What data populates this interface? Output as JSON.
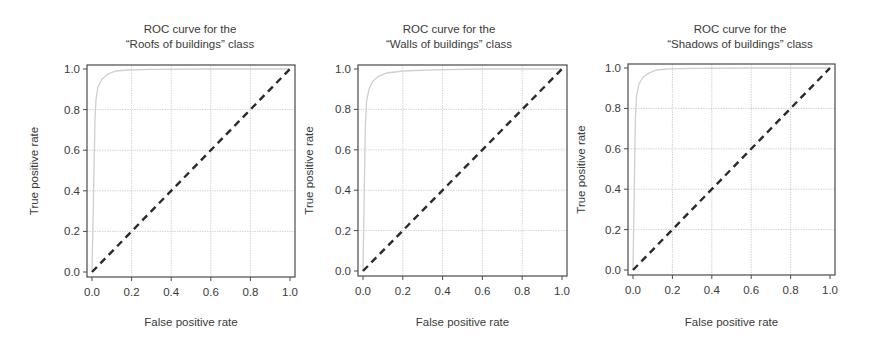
{
  "chart_data": [
    {
      "type": "line",
      "title": "ROC curve for the “Roofs of buildings” class",
      "title_lines": [
        "ROC curve for the",
        "“Roofs of buildings” class"
      ],
      "xlabel": "False positive rate",
      "ylabel": "True positive rate",
      "xlim": [
        0,
        1
      ],
      "ylim": [
        0,
        1
      ],
      "xticks": [
        "0.0",
        "0.2",
        "0.4",
        "0.6",
        "0.8",
        "1.0"
      ],
      "yticks": [
        "0.0",
        "0.2",
        "0.4",
        "0.6",
        "0.8",
        "1.0"
      ],
      "grid": true,
      "legend": null,
      "series": [
        {
          "name": "ROC curve",
          "style": "solid light gray",
          "x": [
            0.0,
            0.01,
            0.015,
            0.02,
            0.03,
            0.05,
            0.08,
            0.12,
            0.18,
            0.3,
            0.6,
            1.0
          ],
          "y": [
            0.0,
            0.5,
            0.75,
            0.85,
            0.91,
            0.95,
            0.975,
            0.99,
            0.995,
            0.998,
            1.0,
            1.0
          ]
        },
        {
          "name": "Random classifier",
          "style": "dashed black",
          "x": [
            0.0,
            1.0
          ],
          "y": [
            0.0,
            1.0
          ]
        }
      ]
    },
    {
      "type": "line",
      "title": "ROC curve for the “Walls of buildings” class",
      "title_lines": [
        "ROC curve for the",
        "“Walls of buildings” class"
      ],
      "xlabel": "False positive rate",
      "ylabel": "True positive rate",
      "xlim": [
        0,
        1
      ],
      "ylim": [
        0,
        1
      ],
      "xticks": [
        "0.0",
        "0.2",
        "0.4",
        "0.6",
        "0.8",
        "1.0"
      ],
      "yticks": [
        "0.0",
        "0.2",
        "0.4",
        "0.6",
        "0.8",
        "1.0"
      ],
      "grid": true,
      "legend": null,
      "series": [
        {
          "name": "ROC curve",
          "style": "solid light gray",
          "x": [
            0.0,
            0.008,
            0.012,
            0.018,
            0.03,
            0.05,
            0.08,
            0.12,
            0.2,
            0.35,
            0.6,
            1.0
          ],
          "y": [
            0.0,
            0.5,
            0.72,
            0.84,
            0.9,
            0.94,
            0.965,
            0.98,
            0.99,
            0.996,
            1.0,
            1.0
          ]
        },
        {
          "name": "Random classifier",
          "style": "dashed black",
          "x": [
            0.0,
            1.0
          ],
          "y": [
            0.0,
            1.0
          ]
        }
      ]
    },
    {
      "type": "line",
      "title": "ROC curve for the “Shadows of buildings” class",
      "title_lines": [
        "ROC curve for the",
        "“Shadows of buildings” class"
      ],
      "xlabel": "False positive rate",
      "ylabel": "True positive rate",
      "xlim": [
        0,
        1
      ],
      "ylim": [
        0,
        1
      ],
      "xticks": [
        "0.0",
        "0.2",
        "0.4",
        "0.6",
        "0.8",
        "1.0"
      ],
      "yticks": [
        "0.0",
        "0.2",
        "0.4",
        "0.6",
        "0.8",
        "1.0"
      ],
      "grid": true,
      "legend": null,
      "series": [
        {
          "name": "ROC curve",
          "style": "solid light gray",
          "x": [
            0.0,
            0.008,
            0.012,
            0.018,
            0.03,
            0.05,
            0.08,
            0.12,
            0.18,
            0.3,
            0.6,
            1.0
          ],
          "y": [
            0.0,
            0.5,
            0.75,
            0.86,
            0.92,
            0.955,
            0.975,
            0.99,
            0.996,
            0.998,
            1.0,
            1.0
          ]
        },
        {
          "name": "Random classifier",
          "style": "dashed black",
          "x": [
            0.0,
            1.0
          ],
          "y": [
            0.0,
            1.0
          ]
        }
      ]
    }
  ],
  "layout": {
    "panels": [
      {
        "left": 87,
        "top": 65,
        "right": 295,
        "bottom": 277,
        "x0": 92,
        "x1": 290,
        "y0": 272,
        "y1": 69,
        "title_cx": 190,
        "ylabel_x": 38
      },
      {
        "left": 358,
        "top": 65,
        "right": 567,
        "bottom": 276,
        "x0": 363,
        "x1": 562,
        "y0": 271,
        "y1": 69,
        "title_cx": 449,
        "ylabel_x": 313
      },
      {
        "left": 628,
        "top": 64,
        "right": 835,
        "bottom": 275,
        "x0": 633,
        "x1": 830,
        "y0": 270,
        "y1": 68,
        "title_cx": 740,
        "ylabel_x": 585
      }
    ],
    "colors": {
      "frame": "#4a4a4a",
      "grid": "#c8c8c8",
      "roc": "#cfcfcf",
      "diag": "#2a2a2a",
      "text": "#3a3a3a"
    }
  }
}
